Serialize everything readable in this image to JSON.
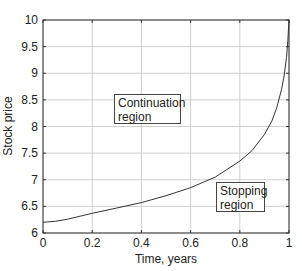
{
  "chart_data": {
    "type": "line",
    "title": "",
    "xlabel": "Time, years",
    "ylabel": "Stock price",
    "xlim": [
      0,
      1
    ],
    "ylim": [
      6,
      10
    ],
    "grid": true,
    "xticks": [
      "0",
      "0.2",
      "0.4",
      "0.6",
      "0.8",
      "1"
    ],
    "yticks": [
      "6",
      "6.5",
      "7",
      "7.5",
      "8",
      "8.5",
      "9",
      "9.5",
      "10"
    ],
    "series": [
      {
        "name": "Optimal exercise boundary",
        "x": [
          0,
          0.05,
          0.1,
          0.2,
          0.3,
          0.4,
          0.5,
          0.6,
          0.7,
          0.8,
          0.85,
          0.9,
          0.93,
          0.95,
          0.97,
          0.98,
          0.99,
          0.995,
          1.0
        ],
        "y": [
          6.2,
          6.22,
          6.26,
          6.37,
          6.47,
          6.57,
          6.7,
          6.85,
          7.05,
          7.35,
          7.55,
          7.85,
          8.1,
          8.35,
          8.7,
          8.95,
          9.3,
          9.6,
          10.0
        ]
      }
    ],
    "annotations": [
      {
        "text_line1": "Continuation",
        "text_line2": "region",
        "x": 0.3,
        "y": 8.3
      },
      {
        "text_line1": "Stopping",
        "text_line2": "region",
        "x": 0.7,
        "y": 6.5
      }
    ]
  },
  "labels": {
    "xlabel": "Time, years",
    "ylabel": "Stock price",
    "continuation_line1": "Continuation",
    "continuation_line2": "region",
    "stopping_line1": "Stopping",
    "stopping_line2": "region"
  }
}
